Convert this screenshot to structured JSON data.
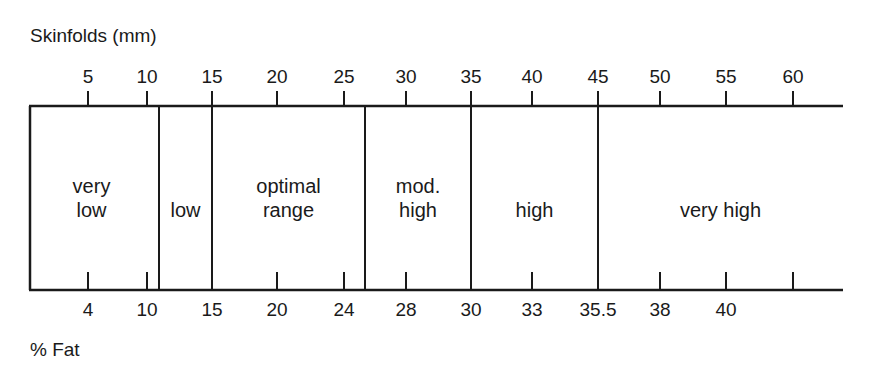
{
  "chart_data": {
    "type": "table",
    "title": "",
    "top_axis": {
      "label": "Skinfolds (mm)",
      "ticks": [
        {
          "label": "5",
          "x": 88
        },
        {
          "label": "10",
          "x": 147
        },
        {
          "label": "15",
          "x": 212
        },
        {
          "label": "20",
          "x": 277
        },
        {
          "label": "25",
          "x": 344
        },
        {
          "label": "30",
          "x": 406
        },
        {
          "label": "35",
          "x": 471
        },
        {
          "label": "40",
          "x": 532
        },
        {
          "label": "45",
          "x": 598
        },
        {
          "label": "50",
          "x": 660
        },
        {
          "label": "55",
          "x": 726
        },
        {
          "label": "60",
          "x": 793
        }
      ]
    },
    "bottom_axis": {
      "label": "% Fat",
      "ticks": [
        {
          "label": "4",
          "x": 88
        },
        {
          "label": "10",
          "x": 147
        },
        {
          "label": "15",
          "x": 212
        },
        {
          "label": "20",
          "x": 277
        },
        {
          "label": "24",
          "x": 344
        },
        {
          "label": "28",
          "x": 406
        },
        {
          "label": "30",
          "x": 471
        },
        {
          "label": "33",
          "x": 532
        },
        {
          "label": "35.5",
          "x": 598
        },
        {
          "label": "38",
          "x": 660
        },
        {
          "label": "40",
          "x": 726
        },
        {
          "label": "",
          "x": 793
        }
      ]
    },
    "zones": [
      {
        "label": "very\nlow",
        "x_start": 30,
        "x_end": 159,
        "skinfolds_mm": "< ~11",
        "percent_fat": "< ~10.5"
      },
      {
        "label": "low",
        "x_start": 159,
        "x_end": 212,
        "skinfolds_mm": "~11-15",
        "percent_fat": "~10.5-15"
      },
      {
        "label": "optimal\nrange",
        "x_start": 212,
        "x_end": 365,
        "skinfolds_mm": "15-~27",
        "percent_fat": "15-~25"
      },
      {
        "label": "mod.\nhigh",
        "x_start": 365,
        "x_end": 471,
        "skinfolds_mm": "~27-35",
        "percent_fat": "~25-30"
      },
      {
        "label": "high",
        "x_start": 471,
        "x_end": 598,
        "skinfolds_mm": "35-45",
        "percent_fat": "30-35.5"
      },
      {
        "label": "very high",
        "x_start": 598,
        "x_end": 843,
        "skinfolds_mm": "> 45",
        "percent_fat": "> 35.5"
      }
    ],
    "layout": {
      "box_top": 106,
      "box_bottom": 290,
      "box_left": 30,
      "line_end": 843
    }
  }
}
